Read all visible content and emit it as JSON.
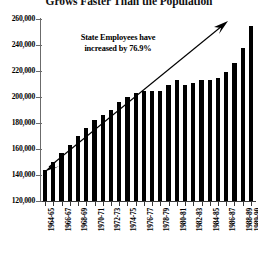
{
  "chart_data": {
    "type": "bar",
    "title": "Grows Faster Than the Population",
    "xlabel": "",
    "ylabel": "",
    "ylim": [
      120000,
      260000
    ],
    "ytick_step": 20000,
    "ytick_labels": [
      "260,000",
      "240,000",
      "220,000",
      "200,000",
      "180,000",
      "160,000",
      "140,000",
      "120,000"
    ],
    "ytick_values": [
      260000,
      240000,
      220000,
      200000,
      180000,
      160000,
      140000,
      120000
    ],
    "grid": false,
    "legend": null,
    "bar_color": "#000000",
    "categories": [
      "1964-65",
      "1965-66",
      "1966-67",
      "1967-68",
      "1968-69",
      "1969-70",
      "1970-71",
      "1971-72",
      "1972-73",
      "1973-74",
      "1974-75",
      "1975-76",
      "1976-77",
      "1977-78",
      "1978-79",
      "1979-80",
      "1980-81",
      "1981-82",
      "1982-83",
      "1983-84",
      "1984-85",
      "1985-86",
      "1986-87",
      "1987-88",
      "1988-89",
      "1989-90"
    ],
    "tick_labels": [
      "1964-65",
      "",
      "1966-67",
      "",
      "1968-69",
      "",
      "1970-71",
      "",
      "1972-73",
      "",
      "1974-75",
      "",
      "1976-77",
      "",
      "1978-79",
      "",
      "1980-81",
      "",
      "1982-83",
      "",
      "1984-85",
      "",
      "1986-87",
      "",
      "1988-89",
      "1989-90"
    ],
    "values": [
      144000,
      150000,
      157000,
      163000,
      170000,
      176000,
      182000,
      186000,
      190000,
      196000,
      200000,
      203000,
      205000,
      205000,
      205000,
      209000,
      213000,
      209000,
      211000,
      213000,
      213000,
      215000,
      219000,
      226000,
      238000,
      255000
    ],
    "annotations": [
      {
        "text_line1": "State Employees have",
        "text_line2": "increased by 76.9%",
        "arrow": "double-headed diagonal from first bar to last bar"
      }
    ]
  }
}
